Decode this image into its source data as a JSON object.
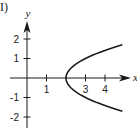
{
  "panel_label": "I)",
  "chart_data": {
    "type": "line",
    "title": "",
    "xlabel": "x",
    "ylabel": "y",
    "equation": "x = y^2 + 2",
    "x_ticks": [
      1,
      3,
      4
    ],
    "y_ticks": [
      2,
      1,
      -1,
      -2
    ],
    "xlim": [
      -1.3,
      5.5
    ],
    "ylim": [
      -2.6,
      2.9
    ],
    "grid": false,
    "series": [
      {
        "name": "parabola",
        "x": [
          4.9,
          4.25,
          3.69,
          3.21,
          2.81,
          2.49,
          2.25,
          2.09,
          2.01,
          2.0,
          2.01,
          2.09,
          2.25,
          2.49,
          2.81,
          3.21,
          3.69,
          4.25,
          4.9
        ],
        "y": [
          1.7,
          1.5,
          1.3,
          1.1,
          0.9,
          0.7,
          0.5,
          0.3,
          0.1,
          0.0,
          -0.1,
          -0.3,
          -0.5,
          -0.7,
          -0.9,
          -1.1,
          -1.3,
          -1.5,
          -1.7
        ]
      }
    ],
    "color": "#1a1a1a"
  }
}
